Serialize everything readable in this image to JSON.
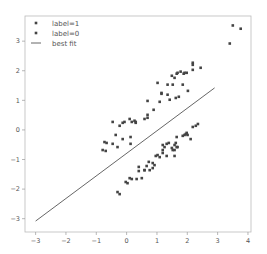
{
  "chart_data": {
    "type": "scatter",
    "title": "",
    "xlabel": "",
    "ylabel": "",
    "xlim": [
      -3.35,
      4.1
    ],
    "ylim": [
      -3.45,
      3.85
    ],
    "xticks": [
      -3,
      -2,
      -1,
      0,
      1,
      2,
      3,
      4
    ],
    "yticks": [
      -3,
      -2,
      -1,
      0,
      1,
      2,
      3
    ],
    "xtick_labels": [
      "−3",
      "−2",
      "−1",
      "0",
      "1",
      "2",
      "3",
      "4"
    ],
    "ytick_labels": [
      "−3",
      "−2",
      "−1",
      "0",
      "1",
      "2",
      "3"
    ],
    "grid": false,
    "legend_position": "upper left",
    "legend": [
      "label=1",
      "label=0",
      "best fit"
    ],
    "series": [
      {
        "name": "label=1",
        "kind": "scatter",
        "color": "#444444",
        "points": [
          [
            3.5,
            3.53
          ],
          [
            3.76,
            3.42
          ],
          [
            3.4,
            2.92
          ],
          [
            2.18,
            2.27
          ],
          [
            2.18,
            2.2
          ],
          [
            2.44,
            2.1
          ],
          [
            2.18,
            2.03
          ],
          [
            1.78,
            1.97
          ],
          [
            1.91,
            1.93
          ],
          [
            1.98,
            1.93
          ],
          [
            1.88,
            1.9
          ],
          [
            1.49,
            1.83
          ],
          [
            1.65,
            1.9
          ],
          [
            1.68,
            1.93
          ],
          [
            1.58,
            1.76
          ],
          [
            1.02,
            1.59
          ],
          [
            1.35,
            1.53
          ],
          [
            1.52,
            1.53
          ],
          [
            1.85,
            1.53
          ],
          [
            1.15,
            1.25
          ],
          [
            1.15,
            1.22
          ],
          [
            1.35,
            1.19
          ],
          [
            2.02,
            1.32
          ],
          [
            1.09,
            0.95
          ],
          [
            1.42,
            1.02
          ],
          [
            1.62,
            1.08
          ],
          [
            1.72,
            1.12
          ],
          [
            0.69,
            0.98
          ],
          [
            0.89,
            0.68
          ],
          [
            0.69,
            0.51
          ],
          [
            0.3,
            0.27
          ],
          [
            0.3,
            0.24
          ],
          [
            0.59,
            0.37
          ],
          [
            0.69,
            0.41
          ],
          [
            -0.46,
            0.27
          ],
          [
            -0.23,
            0.14
          ],
          [
            -0.13,
            0.24
          ],
          [
            -0.07,
            0.27
          ],
          [
            0.1,
            0.37
          ],
          [
            0.17,
            0.27
          ],
          [
            0.26,
            0.31
          ],
          [
            -0.36,
            -0.17
          ],
          [
            -0.13,
            -0.31
          ],
          [
            0.13,
            -0.24
          ],
          [
            -0.73,
            -0.41
          ],
          [
            -0.66,
            -0.44
          ],
          [
            -0.46,
            -0.47
          ],
          [
            -0.3,
            -0.58
          ],
          [
            0.13,
            -0.47
          ],
          [
            -0.79,
            -0.68
          ],
          [
            -0.69,
            -0.71
          ]
        ]
      },
      {
        "name": "label=0",
        "kind": "scatter",
        "color": "#444444",
        "points": [
          [
            2.35,
            0.2
          ],
          [
            2.28,
            0.14
          ],
          [
            2.18,
            0.1
          ],
          [
            1.98,
            -0.1
          ],
          [
            1.95,
            -0.14
          ],
          [
            1.91,
            -0.17
          ],
          [
            2.01,
            -0.17
          ],
          [
            1.85,
            -0.2
          ],
          [
            2.11,
            -0.31
          ],
          [
            1.65,
            -0.24
          ],
          [
            1.62,
            -0.44
          ],
          [
            1.68,
            -0.58
          ],
          [
            1.58,
            -0.68
          ],
          [
            1.19,
            -0.51
          ],
          [
            1.25,
            -0.58
          ],
          [
            1.32,
            -0.47
          ],
          [
            1.39,
            -0.44
          ],
          [
            1.49,
            -0.61
          ],
          [
            1.52,
            -0.68
          ],
          [
            1.58,
            -0.51
          ],
          [
            1.65,
            -0.58
          ],
          [
            1.19,
            -0.68
          ],
          [
            0.96,
            -0.88
          ],
          [
            1.02,
            -0.85
          ],
          [
            1.09,
            -0.92
          ],
          [
            1.19,
            -0.78
          ],
          [
            1.32,
            -0.88
          ],
          [
            1.58,
            -0.88
          ],
          [
            0.73,
            -1.08
          ],
          [
            0.86,
            -1.12
          ],
          [
            0.92,
            -1.19
          ],
          [
            0.66,
            -1.22
          ],
          [
            0.86,
            -1.29
          ],
          [
            0.59,
            -1.36
          ],
          [
            0.4,
            -1.25
          ],
          [
            0.59,
            -1.36
          ],
          [
            0.4,
            -1.39
          ],
          [
            0.76,
            -1.36
          ],
          [
            0.1,
            -1.63
          ],
          [
            0.17,
            -1.66
          ],
          [
            0.33,
            -1.66
          ],
          [
            0.5,
            -1.63
          ],
          [
            -0.03,
            -1.76
          ],
          [
            0.03,
            -1.8
          ],
          [
            -0.3,
            -2.1
          ],
          [
            -0.23,
            -2.17
          ]
        ]
      },
      {
        "name": "best fit",
        "kind": "line",
        "color": "#555555",
        "points": [
          [
            -3.0,
            -3.08
          ],
          [
            2.9,
            1.42
          ]
        ],
        "slope": 0.76,
        "intercept": -0.79
      }
    ]
  }
}
